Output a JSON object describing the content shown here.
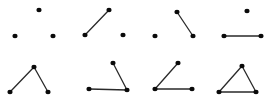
{
  "colors": {
    "vertex": "#0a0a0a",
    "edge": "#2a2a2a",
    "background": "#ffffff"
  },
  "vertices": [
    "top",
    "left",
    "right"
  ],
  "graphs": [
    {
      "id": "g1",
      "edges": []
    },
    {
      "id": "g2",
      "edges": [
        [
          "left",
          "top"
        ]
      ]
    },
    {
      "id": "g3",
      "edges": [
        [
          "top",
          "right"
        ]
      ]
    },
    {
      "id": "g4",
      "edges": [
        [
          "left",
          "right"
        ]
      ]
    },
    {
      "id": "g5",
      "edges": [
        [
          "left",
          "top"
        ],
        [
          "top",
          "right"
        ]
      ]
    },
    {
      "id": "g6",
      "edges": [
        [
          "top",
          "right"
        ],
        [
          "left",
          "right"
        ]
      ]
    },
    {
      "id": "g7",
      "edges": [
        [
          "left",
          "top"
        ],
        [
          "left",
          "right"
        ]
      ]
    },
    {
      "id": "g8",
      "edges": [
        [
          "left",
          "top"
        ],
        [
          "top",
          "right"
        ],
        [
          "left",
          "right"
        ]
      ]
    }
  ]
}
